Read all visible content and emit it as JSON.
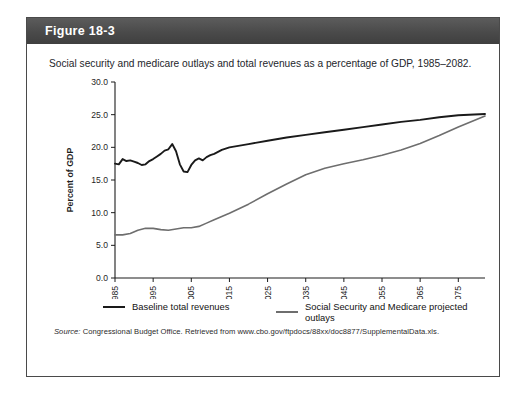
{
  "figure": {
    "number_label": "Figure 18-3",
    "caption": "Social security and medicare outlays and total revenues as a percentage of GDP, 1985–2082.",
    "source_label": "Source:",
    "source_text": "Congressional Budget Office. Retrieved from www.cbo.gov/ftpdocs/88xx/doc8877/SupplementalData.xls."
  },
  "colors": {
    "header_bar": "#4a4a4a",
    "header_text": "#ffffff",
    "revenues_line": "#1a1a1a",
    "outlays_line": "#6e6e6e",
    "axis": "#1c1c1c",
    "panel_border": "#4a4a4a",
    "background": "#ffffff"
  },
  "chart_data": {
    "type": "line",
    "title": "",
    "xlabel": "",
    "ylabel": "Percent of GDP",
    "xlim": [
      1985,
      2082
    ],
    "ylim": [
      0.0,
      30.0
    ],
    "grid": false,
    "legend_position": "bottom",
    "yticks": [
      0.0,
      5.0,
      10.0,
      15.0,
      20.0,
      25.0,
      30.0
    ],
    "ytick_labels": [
      "0.0",
      "5.0",
      "10.0",
      "15.0",
      "20.0",
      "25.0",
      "30.0"
    ],
    "xticks": [
      1985,
      1995,
      2005,
      2015,
      2025,
      2035,
      2045,
      2055,
      2065,
      2075
    ],
    "xtick_labels": [
      "1985",
      "1995",
      "2005",
      "2015",
      "2025",
      "2035",
      "2045",
      "2055",
      "2065",
      "2075"
    ],
    "xtick_rotation": 90,
    "series": [
      {
        "name": "Baseline total revenues",
        "color": "#1a1a1a",
        "width": 1.9,
        "x": [
          1985,
          1986,
          1987,
          1988,
          1989,
          1990,
          1991,
          1992,
          1993,
          1994,
          1995,
          1996,
          1997,
          1998,
          1999,
          2000,
          2001,
          2002,
          2003,
          2004,
          2005,
          2006,
          2007,
          2008,
          2009,
          2010,
          2011,
          2012,
          2013,
          2014,
          2015,
          2020,
          2025,
          2030,
          2035,
          2040,
          2045,
          2050,
          2055,
          2060,
          2065,
          2070,
          2075,
          2082
        ],
        "y": [
          17.5,
          17.4,
          18.2,
          17.9,
          18.0,
          17.8,
          17.6,
          17.3,
          17.4,
          17.9,
          18.2,
          18.6,
          19.0,
          19.5,
          19.7,
          20.5,
          19.4,
          17.4,
          16.3,
          16.2,
          17.3,
          18.0,
          18.3,
          18.0,
          18.5,
          18.8,
          19.0,
          19.3,
          19.6,
          19.8,
          20.0,
          20.5,
          21.0,
          21.5,
          21.9,
          22.3,
          22.7,
          23.1,
          23.5,
          23.9,
          24.2,
          24.6,
          24.9,
          25.1
        ]
      },
      {
        "name": "Social Security and Medicare projected outlays",
        "color": "#6e6e6e",
        "width": 1.6,
        "x": [
          1985,
          1987,
          1989,
          1991,
          1993,
          1995,
          1997,
          1999,
          2001,
          2003,
          2005,
          2007,
          2009,
          2011,
          2013,
          2015,
          2020,
          2025,
          2030,
          2035,
          2040,
          2045,
          2050,
          2055,
          2060,
          2065,
          2070,
          2075,
          2082
        ],
        "y": [
          6.6,
          6.6,
          6.8,
          7.3,
          7.6,
          7.6,
          7.4,
          7.3,
          7.5,
          7.7,
          7.7,
          7.9,
          8.4,
          8.9,
          9.4,
          9.9,
          11.3,
          12.9,
          14.4,
          15.8,
          16.8,
          17.5,
          18.1,
          18.8,
          19.6,
          20.6,
          21.8,
          23.1,
          24.8
        ]
      }
    ]
  }
}
